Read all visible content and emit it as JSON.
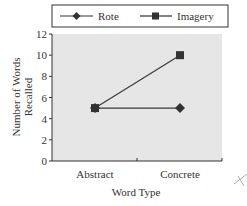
{
  "chart_data": {
    "type": "line",
    "title": "",
    "xlabel": "Word Type",
    "ylabel": "Number of Words Recalled",
    "ylabel_lines": [
      "Number of Words",
      "Recalled"
    ],
    "categories": [
      "Abstract",
      "Concrete"
    ],
    "series": [
      {
        "name": "Rote",
        "marker": "diamond",
        "values": [
          5,
          5
        ]
      },
      {
        "name": "Imagery",
        "marker": "square",
        "values": [
          5,
          10
        ]
      }
    ],
    "yticks": [
      0,
      2,
      4,
      6,
      8,
      10,
      12
    ],
    "ylim": [
      0,
      12
    ],
    "grid": false,
    "legend_position": "top",
    "colors": {
      "plot_bg": "#e6e6e6",
      "line": "#3a3a3a",
      "axis": "#333333"
    }
  }
}
